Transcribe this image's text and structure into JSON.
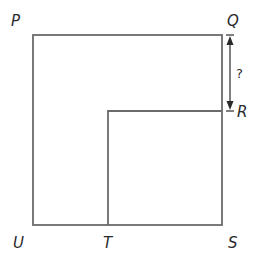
{
  "diagram": {
    "type": "geometry-figure",
    "colors": {
      "line": "#6b6b6b",
      "text": "#2a2a2a",
      "background": "#ffffff"
    },
    "labels": {
      "P": "P",
      "Q": "Q",
      "R": "R",
      "S": "S",
      "T": "T",
      "U": "U"
    },
    "measurement": {
      "segment": "QR",
      "label": "?"
    },
    "shapes": [
      {
        "name": "outer-square",
        "vertices": [
          "P",
          "Q",
          "S",
          "U"
        ]
      },
      {
        "name": "inner-square",
        "vertices": [
          "R",
          "S",
          "T"
        ],
        "note": "smaller square with corner at S, top-left corner interior"
      }
    ]
  }
}
